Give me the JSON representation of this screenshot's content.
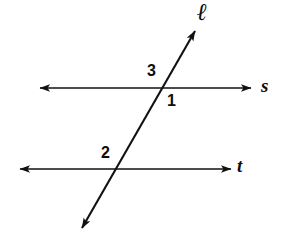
{
  "figure": {
    "background_color": "#ffffff",
    "stroke_color": "#111111",
    "text_color": "#0d0d0d"
  },
  "lines": [
    {
      "id": "line-s",
      "label": "s",
      "type": "horizontal",
      "arrowheads": "both",
      "x1": 38,
      "y1": 88,
      "x2": 253,
      "y2": 88
    },
    {
      "id": "line-t",
      "label": "t",
      "type": "horizontal",
      "arrowheads": "both",
      "x1": 18,
      "y1": 169,
      "x2": 233,
      "y2": 169
    },
    {
      "id": "line-l",
      "label": "ℓ",
      "type": "transversal",
      "arrowheads": "both",
      "x1": 80,
      "y1": 232,
      "x2": 197,
      "y2": 27
    }
  ],
  "intersections": [
    {
      "id": "intersection-l-s",
      "x": 165,
      "y": 88
    },
    {
      "id": "intersection-l-t",
      "x": 118,
      "y": 169
    }
  ],
  "angle_labels": [
    {
      "id": "angle-3",
      "text": "3",
      "x": 147,
      "y": 63,
      "position": "above-left-of-upper-intersection"
    },
    {
      "id": "angle-1",
      "text": "1",
      "x": 167,
      "y": 93,
      "position": "below-right-of-upper-intersection"
    },
    {
      "id": "angle-2",
      "text": "2",
      "x": 101,
      "y": 145,
      "position": "above-left-of-lower-intersection"
    }
  ],
  "line_labels": [
    {
      "id": "label-s",
      "text": "s",
      "x": 261,
      "y": 76
    },
    {
      "id": "label-t",
      "text": "t",
      "x": 237,
      "y": 156
    },
    {
      "id": "label-l",
      "text": "ℓ",
      "x": 197,
      "y": 0
    }
  ]
}
